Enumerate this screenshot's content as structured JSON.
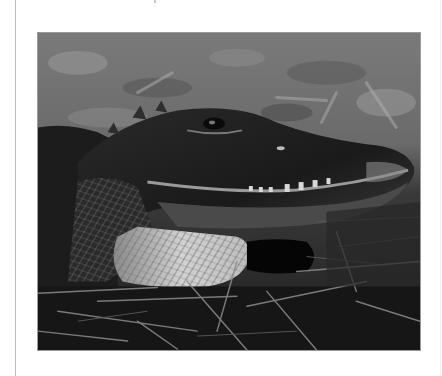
{
  "page": {
    "background": "#ffffff",
    "rule_color": "#bdbdbd"
  },
  "photo": {
    "subject": "American alligator head resting on straw and grass",
    "tone": "grayscale",
    "alt": "Close-up black and white photograph of an alligator's head lying on dry grass"
  },
  "icons": {
    "photo": "photograph"
  }
}
